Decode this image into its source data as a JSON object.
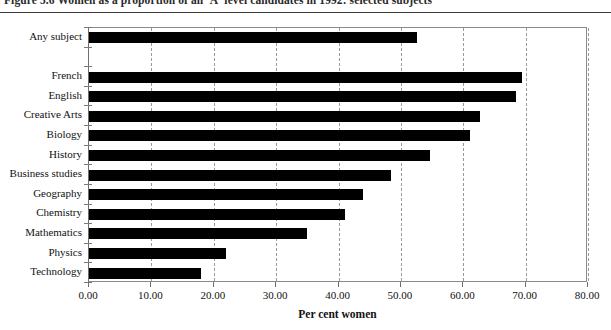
{
  "figure": {
    "title": "Figure 5.6   Women as a proportion of all 'A' level candidates in 1992: selected subjects"
  },
  "chart_data": {
    "type": "bar",
    "orientation": "horizontal",
    "title": "Figure 5.6   Women as a proportion of all 'A' level candidates in 1992: selected subjects",
    "xlabel": "Per cent women",
    "ylabel": "",
    "xlim": [
      0,
      80
    ],
    "xticks": [
      0,
      10,
      20,
      30,
      40,
      50,
      60,
      70,
      80
    ],
    "xtick_labels": [
      "0.00",
      "10.00",
      "20.00",
      "30.00",
      "40.00",
      "50.00",
      "60.00",
      "70.00",
      "80.00"
    ],
    "grid": "vertical-dashed",
    "legend": "none",
    "bar_color": "#000000",
    "categories": [
      "Any subject",
      "French",
      "English",
      "Creative Arts",
      "Biology",
      "History",
      "Business studies",
      "Geography",
      "Chemistry",
      "Mathematics",
      "Physics",
      "Technology"
    ],
    "values": [
      52.6,
      69.4,
      68.5,
      62.7,
      61.1,
      54.7,
      48.4,
      43.9,
      41.1,
      34.9,
      21.9,
      17.9
    ],
    "gap_after_index": 0
  }
}
